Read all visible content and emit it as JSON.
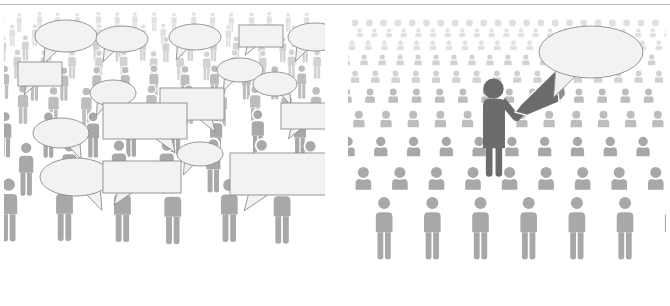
{
  "image": {
    "title": "Crowd communication comparison illustration",
    "background_color": "#ffffff",
    "divider_rule_color": "#b9b9b9",
    "width": 670,
    "height": 306
  },
  "palette": {
    "crowd_front": "#a8a8a8",
    "crowd_mid": "#bdbdbd",
    "crowd_back": "#d2d2d2",
    "crowd_far": "#e0e0e0",
    "leader_dark": "#6b6b6b",
    "bubble_fill": "#f2f2f2",
    "bubble_stroke": "#8c8c8c",
    "separator": "#ffffff"
  },
  "panels": [
    {
      "id": "left",
      "name": "noisy-crowd-panel",
      "caption": "Crowd of people each with their own speech bubble",
      "figure_count": 74,
      "leader": false,
      "speech_bubbles": [
        {
          "shape": "ellipse",
          "cx": 62,
          "cy": 26,
          "rx": 31,
          "ry": 16,
          "tail": "down-left"
        },
        {
          "shape": "ellipse",
          "cx": 118,
          "cy": 29,
          "rx": 26,
          "ry": 13,
          "tail": "down-left"
        },
        {
          "shape": "ellipse",
          "cx": 191,
          "cy": 27,
          "rx": 26,
          "ry": 13,
          "tail": "down-left"
        },
        {
          "shape": "rect",
          "cx": 257,
          "cy": 26,
          "rx": 22,
          "ry": 11,
          "tail": "down-left"
        },
        {
          "shape": "ellipse",
          "cx": 311,
          "cy": 27,
          "rx": 27,
          "ry": 14,
          "tail": "down-left"
        },
        {
          "shape": "rect",
          "cx": 36,
          "cy": 64,
          "rx": 22,
          "ry": 12,
          "tail": "down-left"
        },
        {
          "shape": "ellipse",
          "cx": 109,
          "cy": 83,
          "rx": 23,
          "ry": 13,
          "tail": "down-left"
        },
        {
          "shape": "ellipse",
          "cx": 236,
          "cy": 60,
          "rx": 23,
          "ry": 12,
          "tail": "down-left"
        },
        {
          "shape": "ellipse",
          "cx": 271,
          "cy": 74,
          "rx": 22,
          "ry": 12,
          "tail": "down-right"
        },
        {
          "shape": "rect",
          "cx": 188,
          "cy": 94,
          "rx": 32,
          "ry": 16,
          "tail": "down-right"
        },
        {
          "shape": "rect",
          "cx": 141,
          "cy": 111,
          "rx": 42,
          "ry": 18,
          "tail": "down-right"
        },
        {
          "shape": "rect",
          "cx": 304,
          "cy": 106,
          "rx": 27,
          "ry": 13,
          "tail": "down-left"
        },
        {
          "shape": "ellipse",
          "cx": 57,
          "cy": 123,
          "rx": 28,
          "ry": 15,
          "tail": "down-right"
        },
        {
          "shape": "ellipse",
          "cx": 196,
          "cy": 144,
          "rx": 23,
          "ry": 12,
          "tail": "down-left"
        },
        {
          "shape": "ellipse",
          "cx": 72,
          "cy": 167,
          "rx": 36,
          "ry": 19,
          "tail": "down-right"
        },
        {
          "shape": "rect",
          "cx": 138,
          "cy": 167,
          "rx": 39,
          "ry": 16,
          "tail": "down-left"
        },
        {
          "shape": "rect",
          "cx": 277,
          "cy": 164,
          "rx": 51,
          "ry": 21,
          "tail": "down-left"
        }
      ],
      "bubble_count": 17
    },
    {
      "id": "right",
      "name": "single-voice-panel",
      "caption": "Crowd listening to one dark leader figure holding a megaphone",
      "figure_count": 96,
      "leader": true,
      "leader_label": "leader-with-megaphone",
      "megaphone": {
        "name": "megaphone-icon",
        "color": "#6b6b6b"
      },
      "speech_bubbles": [
        {
          "shape": "ellipse",
          "cx": 243,
          "cy": 42,
          "rx": 52,
          "ry": 26,
          "tail": "down-left"
        }
      ],
      "bubble_count": 1
    }
  ],
  "icon_names": [
    "person-pictogram-icon",
    "speech-bubble-oval-icon",
    "speech-bubble-rect-icon",
    "megaphone-icon",
    "crowd-row-icon"
  ]
}
